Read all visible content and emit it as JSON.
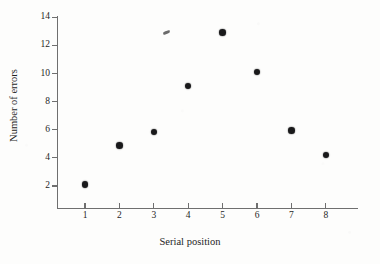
{
  "figure": {
    "background_color": "#fdfdfc",
    "ink_color": "#19191a",
    "axis_color": "#6f6f6f"
  },
  "chart_data": {
    "type": "scatter",
    "title": "",
    "xlabel": "Serial position",
    "ylabel": "Number of errors",
    "x": [
      1,
      2,
      3,
      4,
      5,
      6,
      7,
      8
    ],
    "values": [
      2.1,
      4.9,
      5.85,
      9.1,
      12.9,
      10.1,
      5.95,
      4.2
    ],
    "series": [
      {
        "name": "Number of errors",
        "values": [
          2.1,
          4.9,
          5.85,
          9.1,
          12.9,
          10.1,
          5.95,
          4.2
        ]
      }
    ],
    "points": [
      {
        "x": 1,
        "y": 2.1
      },
      {
        "x": 2,
        "y": 4.9
      },
      {
        "x": 3,
        "y": 5.85
      },
      {
        "x": 4,
        "y": 9.1
      },
      {
        "x": 5,
        "y": 12.9
      },
      {
        "x": 6,
        "y": 10.1
      },
      {
        "x": 7,
        "y": 5.95
      },
      {
        "x": 8,
        "y": 4.2
      }
    ],
    "xlim": [
      0.25,
      9.0
    ],
    "ylim": [
      0,
      14.8
    ],
    "xticks": [
      1,
      2,
      3,
      4,
      5,
      6,
      7,
      8
    ],
    "xtick_labels": [
      "1",
      "2",
      "3",
      "4",
      "5",
      "6",
      "7",
      "8"
    ],
    "yticks": [
      2,
      4,
      6,
      8,
      10,
      12,
      14
    ],
    "ytick_labels": [
      "2",
      "4",
      "6",
      "8",
      "10",
      "12",
      "14"
    ],
    "grid": false,
    "legend": false,
    "legend_position": "none",
    "marker": "filled-circle",
    "marker_color": "#19191a"
  },
  "artifacts": {
    "scan_speck_label": "scan-artifact"
  }
}
